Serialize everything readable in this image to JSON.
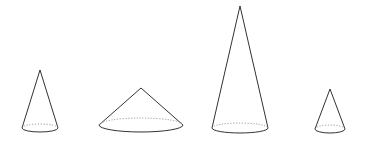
{
  "figure": {
    "width": 367,
    "height": 152,
    "background": "#ffffff",
    "stroke_color": "#333333",
    "hidden_stroke_color": "#999999",
    "cones": [
      {
        "id": "cone-1",
        "apex": [
          40,
          70
        ],
        "base_center": [
          40,
          128
        ],
        "rx": 18,
        "ry": 4
      },
      {
        "id": "cone-2",
        "apex": [
          141,
          88
        ],
        "base_center": [
          141,
          125
        ],
        "rx": 42,
        "ry": 7
      },
      {
        "id": "cone-3",
        "apex": [
          240,
          6
        ],
        "base_center": [
          240,
          128
        ],
        "rx": 28,
        "ry": 5
      },
      {
        "id": "cone-4",
        "apex": [
          330,
          89
        ],
        "base_center": [
          330,
          129
        ],
        "rx": 15,
        "ry": 4
      }
    ]
  }
}
